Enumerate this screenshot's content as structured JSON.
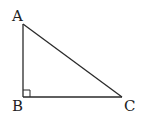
{
  "diagram": {
    "type": "right-triangle",
    "vertices": [
      {
        "label": "A",
        "x": 23,
        "y": 24
      },
      {
        "label": "B",
        "x": 23,
        "y": 97
      },
      {
        "label": "C",
        "x": 122,
        "y": 97
      }
    ],
    "right_angle_at": "B",
    "stroke_color": "#2a2a2a",
    "background": "#ffffff"
  },
  "labels": {
    "a": "A",
    "b": "B",
    "c": "C"
  }
}
